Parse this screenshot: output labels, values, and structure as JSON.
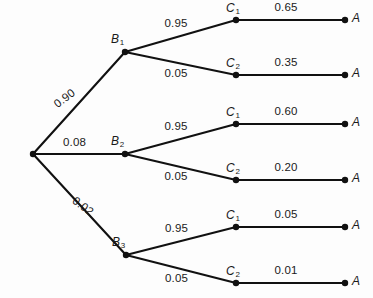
{
  "diagram": {
    "type": "probability-tree",
    "title": "",
    "root": {
      "label": "",
      "x": 33,
      "y": 154
    },
    "stage1": {
      "nodes": [
        {
          "id": "B1",
          "label": "B",
          "sub": "1",
          "x": 125,
          "y": 52,
          "prob": "0.90",
          "prob_rotation": -37
        },
        {
          "id": "B2",
          "label": "B",
          "sub": "2",
          "x": 125,
          "y": 154,
          "prob": "0.08",
          "prob_rotation": 0
        },
        {
          "id": "B3",
          "label": "B",
          "sub": "3",
          "x": 126,
          "y": 255,
          "prob": "0.02",
          "prob_rotation": 37
        }
      ]
    },
    "stage2": {
      "nodes": [
        {
          "id": "C1a",
          "label": "C",
          "sub": "1",
          "parent": "B1",
          "x": 236,
          "y": 20,
          "prob": "0.95"
        },
        {
          "id": "C2a",
          "label": "C",
          "sub": "2",
          "parent": "B1",
          "x": 236,
          "y": 75,
          "prob": "0.05"
        },
        {
          "id": "C1b",
          "label": "C",
          "sub": "1",
          "parent": "B2",
          "x": 236,
          "y": 124,
          "prob": "0.95"
        },
        {
          "id": "C2b",
          "label": "C",
          "sub": "2",
          "parent": "B2",
          "x": 236,
          "y": 180,
          "prob": "0.05"
        },
        {
          "id": "C1c",
          "label": "C",
          "sub": "1",
          "parent": "B3",
          "x": 236,
          "y": 227,
          "prob": "0.95"
        },
        {
          "id": "C2c",
          "label": "C",
          "sub": "2",
          "parent": "B3",
          "x": 236,
          "y": 283,
          "prob": "0.05"
        }
      ]
    },
    "stage3": {
      "nodes": [
        {
          "id": "A1",
          "label": "A",
          "parent": "C1a",
          "x": 345,
          "y": 20,
          "prob": "0.65"
        },
        {
          "id": "A2",
          "label": "A",
          "parent": "C2a",
          "x": 345,
          "y": 75,
          "prob": "0.35"
        },
        {
          "id": "A3",
          "label": "A",
          "parent": "C1b",
          "x": 345,
          "y": 124,
          "prob": "0.60"
        },
        {
          "id": "A4",
          "label": "A",
          "parent": "C2b",
          "x": 345,
          "y": 180,
          "prob": "0.20"
        },
        {
          "id": "A5",
          "label": "A",
          "parent": "C1c",
          "x": 345,
          "y": 227,
          "prob": "0.05"
        },
        {
          "id": "A6",
          "label": "A",
          "parent": "C2c",
          "x": 345,
          "y": 283,
          "prob": "0.01"
        }
      ]
    },
    "colors": {
      "line": "#111111",
      "text": "#1a1a1a",
      "background": "#fdfdfd"
    }
  }
}
